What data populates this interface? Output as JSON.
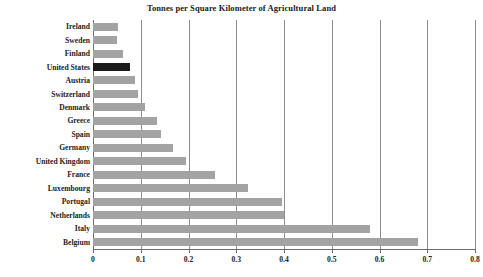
{
  "chart_data": {
    "type": "bar",
    "orientation": "horizontal",
    "title": "Tonnes per Square Kilometer of Agricultural Land",
    "xlabel": "",
    "ylabel": "",
    "xlim": [
      0,
      0.8
    ],
    "xticks": [
      "0",
      "0.1",
      "0.2",
      "0.3",
      "0.4",
      "0.5",
      "0.6",
      "0.7",
      "0.8"
    ],
    "xtick_values": [
      0,
      0.1,
      0.2,
      0.3,
      0.4,
      0.5,
      0.6,
      0.7,
      0.8
    ],
    "grid": "vertical",
    "legend": "none",
    "categories": [
      "Ireland",
      "Sweden",
      "Finland",
      "United States",
      "Austria",
      "Switzerland",
      "Denmark",
      "Greece",
      "Spain",
      "Germany",
      "United Kingdom",
      "France",
      "Luxembourg",
      "Portugal",
      "Netherlands",
      "Italy",
      "Belgium"
    ],
    "values": [
      0.052,
      0.05,
      0.062,
      0.078,
      0.087,
      0.095,
      0.108,
      0.135,
      0.142,
      0.168,
      0.195,
      0.255,
      0.325,
      0.395,
      0.4,
      0.58,
      0.68
    ],
    "highlight_category": "United States",
    "colors": {
      "bar": "#a3a3a3",
      "highlight_bar": "#1b1b1b",
      "gridline": "#8e8e8e",
      "axis": "#6b6b6b",
      "text": "#1b1b1b",
      "background": "#ffffff"
    }
  }
}
